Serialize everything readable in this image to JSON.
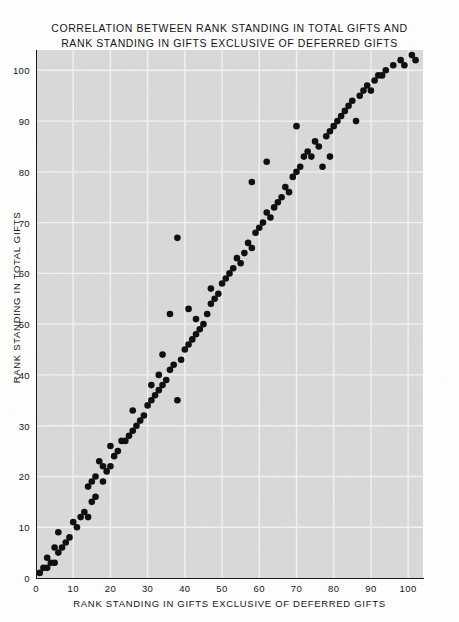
{
  "figure": {
    "title_line1": "CORRELATION BETWEEN RANK STANDING IN TOTAL GIFTS AND",
    "title_line2": "RANK STANDING IN GIFTS EXCLUSIVE OF DEFERRED GIFTS",
    "background_color": "#ffffff",
    "plot_background_color": "#d9d9d9",
    "gridline_color": "#f2f2f2",
    "marker_color": "#101010",
    "axis_color": "#1a1a1a"
  },
  "chart_data": {
    "type": "scatter",
    "title": "CORRELATION BETWEEN RANK STANDING IN TOTAL GIFTS AND RANK STANDING IN GIFTS EXCLUSIVE OF DEFERRED GIFTS",
    "xlabel": "RANK STANDING IN GIFTS EXCLUSIVE OF DEFERRED GIFTS",
    "ylabel": "RANK STANDING IN TOTAL GIFTS",
    "xlim": [
      0,
      104
    ],
    "ylim": [
      0,
      104
    ],
    "xticks": [
      0,
      10,
      20,
      30,
      40,
      50,
      60,
      70,
      80,
      90,
      100
    ],
    "yticks": [
      0,
      10,
      20,
      30,
      40,
      50,
      60,
      70,
      80,
      90,
      100
    ],
    "xtick_labels": [
      "0",
      "10",
      "20",
      "30",
      "40",
      "50",
      "60",
      "70",
      "80",
      "90",
      "100"
    ],
    "ytick_labels": [
      "0",
      "10",
      "20",
      "30",
      "40",
      "50",
      "60",
      "70",
      "80",
      "90",
      "100"
    ],
    "grid": true,
    "grid_spacing": 10,
    "legend": null,
    "marker_size": 3.3,
    "series": [
      {
        "name": "institutions",
        "points": [
          [
            1,
            1
          ],
          [
            2,
            2
          ],
          [
            3,
            2
          ],
          [
            4,
            3
          ],
          [
            3,
            4
          ],
          [
            5,
            3
          ],
          [
            6,
            5
          ],
          [
            5,
            6
          ],
          [
            7,
            6
          ],
          [
            6,
            9
          ],
          [
            8,
            7
          ],
          [
            9,
            8
          ],
          [
            10,
            11
          ],
          [
            11,
            10
          ],
          [
            12,
            12
          ],
          [
            13,
            13
          ],
          [
            14,
            12
          ],
          [
            15,
            15
          ],
          [
            14,
            18
          ],
          [
            16,
            16
          ],
          [
            15,
            19
          ],
          [
            16,
            20
          ],
          [
            17,
            23
          ],
          [
            18,
            19
          ],
          [
            19,
            21
          ],
          [
            18,
            22
          ],
          [
            20,
            22
          ],
          [
            21,
            24
          ],
          [
            20,
            26
          ],
          [
            22,
            25
          ],
          [
            23,
            27
          ],
          [
            24,
            27
          ],
          [
            25,
            28
          ],
          [
            26,
            29
          ],
          [
            27,
            30
          ],
          [
            28,
            31
          ],
          [
            26,
            33
          ],
          [
            29,
            32
          ],
          [
            30,
            34
          ],
          [
            31,
            35
          ],
          [
            32,
            36
          ],
          [
            31,
            38
          ],
          [
            33,
            37
          ],
          [
            34,
            38
          ],
          [
            33,
            40
          ],
          [
            35,
            39
          ],
          [
            36,
            41
          ],
          [
            34,
            44
          ],
          [
            37,
            42
          ],
          [
            36,
            52
          ],
          [
            38,
            35
          ],
          [
            39,
            43
          ],
          [
            40,
            45
          ],
          [
            38,
            67
          ],
          [
            41,
            46
          ],
          [
            42,
            47
          ],
          [
            41,
            53
          ],
          [
            43,
            48
          ],
          [
            44,
            49
          ],
          [
            43,
            51
          ],
          [
            45,
            50
          ],
          [
            46,
            52
          ],
          [
            47,
            54
          ],
          [
            48,
            55
          ],
          [
            47,
            57
          ],
          [
            49,
            56
          ],
          [
            50,
            58
          ],
          [
            51,
            59
          ],
          [
            52,
            60
          ],
          [
            53,
            61
          ],
          [
            54,
            63
          ],
          [
            55,
            62
          ],
          [
            56,
            64
          ],
          [
            57,
            66
          ],
          [
            58,
            65
          ],
          [
            59,
            68
          ],
          [
            58,
            78
          ],
          [
            60,
            69
          ],
          [
            61,
            70
          ],
          [
            62,
            72
          ],
          [
            63,
            71
          ],
          [
            62,
            82
          ],
          [
            64,
            73
          ],
          [
            65,
            74
          ],
          [
            66,
            75
          ],
          [
            67,
            77
          ],
          [
            68,
            76
          ],
          [
            69,
            79
          ],
          [
            70,
            80
          ],
          [
            71,
            81
          ],
          [
            72,
            83
          ],
          [
            70,
            89
          ],
          [
            73,
            84
          ],
          [
            74,
            83
          ],
          [
            75,
            86
          ],
          [
            76,
            85
          ],
          [
            77,
            81
          ],
          [
            78,
            87
          ],
          [
            79,
            88
          ],
          [
            80,
            89
          ],
          [
            79,
            83
          ],
          [
            81,
            90
          ],
          [
            82,
            91
          ],
          [
            83,
            92
          ],
          [
            84,
            93
          ],
          [
            85,
            94
          ],
          [
            86,
            90
          ],
          [
            87,
            95
          ],
          [
            88,
            96
          ],
          [
            89,
            97
          ],
          [
            90,
            96
          ],
          [
            91,
            98
          ],
          [
            92,
            99
          ],
          [
            93,
            99
          ],
          [
            94,
            100
          ],
          [
            96,
            101
          ],
          [
            98,
            102
          ],
          [
            99,
            101
          ],
          [
            101,
            103
          ],
          [
            102,
            102
          ]
        ]
      }
    ]
  },
  "axes": {
    "x_title": "RANK STANDING IN GIFTS EXCLUSIVE OF DEFERRED GIFTS",
    "y_title": "RANK STANDING IN TOTAL GIFTS"
  }
}
